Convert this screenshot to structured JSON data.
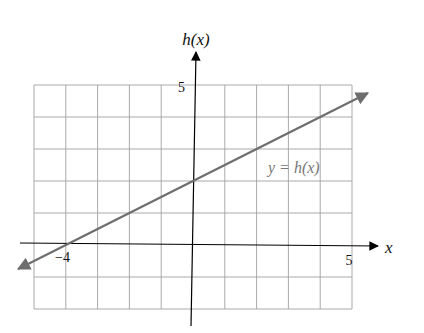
{
  "chart_data": {
    "type": "line",
    "title": "",
    "xlabel": "x",
    "ylabel": "h(x)",
    "xlim": [
      -5,
      5
    ],
    "ylim": [
      -2,
      5
    ],
    "grid": true,
    "tick_labels": {
      "x": [
        "-4",
        "5"
      ],
      "y": [
        "5"
      ]
    },
    "series": [
      {
        "name": "y = h(x)",
        "equation": "h(x) = 0.5x + 2",
        "x": [
          -5.5,
          -4,
          0,
          5.5
        ],
        "y": [
          -0.75,
          0,
          2,
          4.75
        ]
      }
    ],
    "annotations": [
      {
        "text": "y = h(x)",
        "x": 3.0,
        "y": 2.3
      }
    ],
    "colors": {
      "line": "#6e6e6e",
      "grid": "#a0a0a0",
      "axis": "#000000"
    }
  },
  "labels": {
    "y_axis": "h(x)",
    "x_axis": "x",
    "x_tick_neg4": "−4",
    "x_tick_5": "5",
    "y_tick_5": "5",
    "curve_label": "y = h(x)"
  }
}
